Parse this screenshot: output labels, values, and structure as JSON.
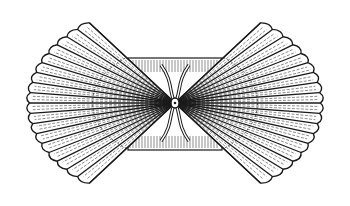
{
  "illustration": {
    "subject": "scallop shell valves (opened pair) line engraving",
    "stroke_color": "#1a1a1a",
    "background": "#ffffff"
  }
}
